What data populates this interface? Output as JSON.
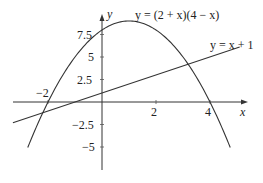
{
  "chart_data": {
    "type": "line",
    "title": "",
    "xlabel": "x",
    "ylabel": "y",
    "xlim": [
      -3.6,
      5.3
    ],
    "ylim": [
      -8.6,
      10.5
    ],
    "grid": false,
    "x_ticks": [
      {
        "value": -2,
        "label": "−2"
      },
      {
        "value": 2,
        "label": "2"
      },
      {
        "value": 4,
        "label": "4"
      }
    ],
    "y_ticks": [
      {
        "value": 7.5,
        "label": "7.5"
      },
      {
        "value": 5,
        "label": "5"
      },
      {
        "value": 2.5,
        "label": "2.5"
      },
      {
        "value": -2.5,
        "label": "−2.5"
      },
      {
        "value": -5,
        "label": "−5"
      }
    ],
    "series": [
      {
        "name": "y = (2 + x)(4 − x)",
        "formula": "(2+x)*(4-x)",
        "x_range": [
          -2.75,
          4.75
        ],
        "sample_points": [
          {
            "x": -2.75,
            "y": -5.06
          },
          {
            "x": -2,
            "y": 0
          },
          {
            "x": -1,
            "y": 5
          },
          {
            "x": 0,
            "y": 8
          },
          {
            "x": 1,
            "y": 9
          },
          {
            "x": 2,
            "y": 8
          },
          {
            "x": 3,
            "y": 5
          },
          {
            "x": 4,
            "y": 0
          },
          {
            "x": 4.75,
            "y": -5.06
          }
        ]
      },
      {
        "name": "y = x + 1",
        "formula": "x+1",
        "x_range": [
          -3.3,
          5.1
        ],
        "sample_points": [
          {
            "x": -3.3,
            "y": -2.3
          },
          {
            "x": 0,
            "y": 1
          },
          {
            "x": 5.1,
            "y": 6.1
          }
        ]
      }
    ],
    "annotations": [
      {
        "text": "y = (2 + x)(4 − x)",
        "near": "parabola vertex"
      },
      {
        "text": "y = x + 1",
        "near": "line right end"
      }
    ]
  },
  "labels": {
    "x_axis": "x",
    "y_axis": "y",
    "parabola": "y = (2 + x)(4 − x)",
    "line": "y = x + 1",
    "tick_x_neg2": "−2",
    "tick_x_2": "2",
    "tick_x_4": "4",
    "tick_y_7_5": "7.5",
    "tick_y_5": "5",
    "tick_y_2_5": "2.5",
    "tick_y_neg2_5": "−2.5",
    "tick_y_neg5": "−5"
  }
}
